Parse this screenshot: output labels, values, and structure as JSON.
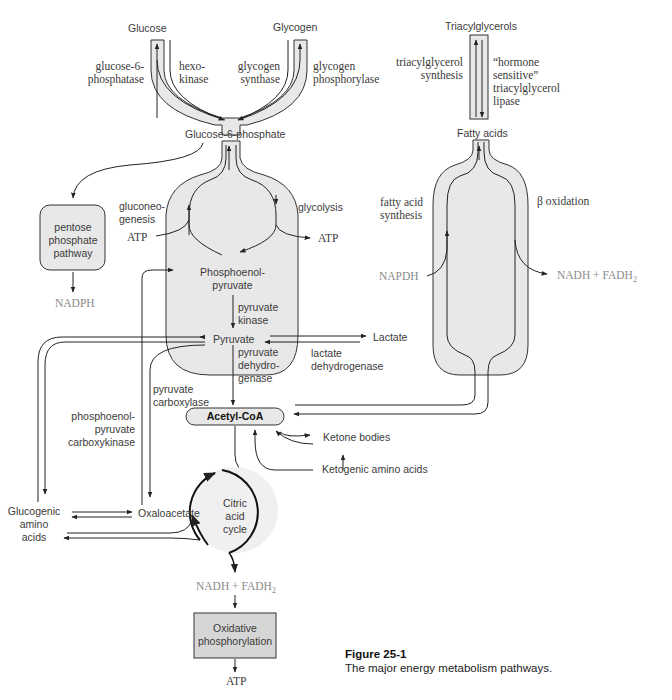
{
  "figure": {
    "caption_title": "Figure 25-1",
    "caption_text": "The major energy metabolism pathways."
  },
  "metabolites": {
    "glucose": "Glucose",
    "glycogen": "Glycogen",
    "g6p": "Glucose-6-phosphate",
    "triacylglycerols": "Triacylglycerols",
    "fatty_acids": "Fatty acids",
    "pep_line1": "Phosphoenol-",
    "pep_line2": "pyruvate",
    "pyruvate": "Pyruvate",
    "lactate": "Lactate",
    "acetyl_coa": "Acetyl-CoA",
    "ketone_bodies": "Ketone bodies",
    "ketogenic_aa": "Ketogenic amino acids",
    "glucogenic_aa_1": "Glucogenic",
    "glucogenic_aa_2": "amino",
    "glucogenic_aa_3": "acids",
    "oxaloacetate": "Oxaloacetate",
    "citric_1": "Citric",
    "citric_2": "acid",
    "citric_3": "cycle",
    "nadph_left": "NADPH",
    "napdh_right": "NAPDH",
    "nadh_fadh_right": "NADH  +  FADH",
    "nadh_fadh_bottom": "NADH + FADH",
    "sub2": "2",
    "atp_left": "ATP",
    "atp_right": "ATP",
    "atp_bottom": "ATP"
  },
  "boxes": {
    "pentose_1": "pentose",
    "pentose_2": "phosphate",
    "pentose_3": "pathway",
    "oxphos_1": "Oxidative",
    "oxphos_2": "phosphorylation"
  },
  "enzymes": {
    "g6pase_1": "glucose-6-",
    "g6pase_2": "phosphatase",
    "hexokinase_1": "hexo-",
    "hexokinase_2": "kinase",
    "glycogen_synthase_1": "glycogen",
    "glycogen_synthase_2": "synthase",
    "glycogen_phosphorylase_1": "glycogen",
    "glycogen_phosphorylase_2": "phosphorylase",
    "tag_synthesis_1": "triacylglycerol",
    "tag_synthesis_2": "synthesis",
    "hsl_1": "“hormone",
    "hsl_2": "sensitive”",
    "hsl_3": "triacylglycerol",
    "hsl_4": "lipase",
    "gluconeogenesis_1": "gluconeo-",
    "gluconeogenesis_2": "genesis",
    "glycolysis": "glycolysis",
    "fa_synthesis_1": "fatty acid",
    "fa_synthesis_2": "synthesis",
    "beta_oxidation": "β oxidation",
    "pyruvate_kinase_1": "pyruvate",
    "pyruvate_kinase_2": "kinase",
    "pdh_1": "pyruvate",
    "pdh_2": "dehydro-",
    "pdh_3": "genase",
    "ldh_1": "lactate",
    "ldh_2": "dehydrogenase",
    "pyr_carboxylase_1": "pyruvate",
    "pyr_carboxylase_2": "carboxylase",
    "pepck_1": "phosphoenol-",
    "pepck_2": "pyruvate",
    "pepck_3": "carboxykinase"
  },
  "colors": {
    "fill": "#e8e8e8",
    "stroke": "#333333",
    "box_fill": "#d6d6d6"
  }
}
